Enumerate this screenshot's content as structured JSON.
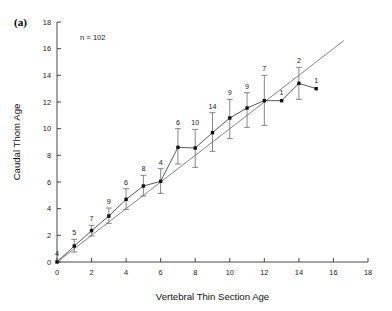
{
  "figure": {
    "panel_label": "(a)",
    "annotation": "n = 102"
  },
  "chart_data": {
    "type": "scatter",
    "title": "",
    "xlabel": "Vertebral Thin Section Age",
    "ylabel": "Caudal Thom Age",
    "xlim": [
      0,
      18
    ],
    "ylim": [
      0,
      18
    ],
    "xticks": [
      0,
      2,
      4,
      6,
      8,
      10,
      12,
      14,
      16,
      18
    ],
    "yticks": [
      0,
      2,
      4,
      6,
      8,
      10,
      12,
      14,
      16,
      18
    ],
    "xticklabels": [
      "0",
      "2",
      "4",
      "6",
      "8",
      "10",
      "12",
      "14",
      "16",
      "18"
    ],
    "yticklabels": [
      "0",
      "2",
      "4",
      "6",
      "8",
      "10",
      "12",
      "14",
      "16",
      "18"
    ],
    "grid": false,
    "legend": "none",
    "annotations": [
      "n = 102",
      "(a)"
    ],
    "reference_line": {
      "label": "1:1 line",
      "slope": 1,
      "intercept": 0,
      "x_start": 0,
      "x_end": 16.6,
      "color": "#6e6e6e"
    },
    "series": [
      {
        "name": "Mean caudal Thom age",
        "marker": "square",
        "color": "#111111",
        "x": [
          0,
          1,
          2,
          3,
          4,
          5,
          6,
          7,
          8,
          9,
          10,
          11,
          12,
          13,
          14,
          15
        ],
        "y": [
          0.0,
          1.2,
          2.35,
          3.45,
          4.7,
          5.7,
          6.05,
          8.6,
          8.55,
          9.7,
          10.8,
          11.55,
          12.1,
          12.1,
          13.4,
          13.0
        ],
        "yerr_low": [
          0.0,
          0.75,
          1.95,
          2.9,
          3.95,
          4.95,
          5.15,
          7.35,
          7.1,
          8.3,
          9.25,
          10.1,
          10.25,
          0.0,
          12.2,
          0.0
        ],
        "yerr_high": [
          0.0,
          1.7,
          2.75,
          4.05,
          5.5,
          6.5,
          7.0,
          10.0,
          9.95,
          11.2,
          12.2,
          12.7,
          14.0,
          0.0,
          14.6,
          0.0
        ],
        "n_labels": [
          "4",
          "5",
          "7",
          "9",
          "6",
          "8",
          "4",
          "6",
          "10",
          "14",
          "9",
          "9",
          "7",
          "1",
          "2",
          "1"
        ]
      }
    ]
  }
}
